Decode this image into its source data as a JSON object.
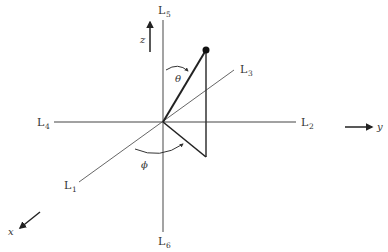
{
  "diagram": {
    "title": "",
    "axis_lines": [
      {
        "id": "L1",
        "base": "L",
        "sub": "1"
      },
      {
        "id": "L2",
        "base": "L",
        "sub": "2"
      },
      {
        "id": "L3",
        "base": "L",
        "sub": "3"
      },
      {
        "id": "L4",
        "base": "L",
        "sub": "4"
      },
      {
        "id": "L5",
        "base": "L",
        "sub": "5"
      },
      {
        "id": "L6",
        "base": "L",
        "sub": "6"
      }
    ],
    "direction_labels": {
      "x": "x",
      "y": "y",
      "z": "z"
    },
    "angles": {
      "theta": "θ",
      "phi": "ϕ"
    },
    "colors": {
      "thin_line": "#555555",
      "thick_line": "#222222",
      "text": "#333333"
    }
  }
}
